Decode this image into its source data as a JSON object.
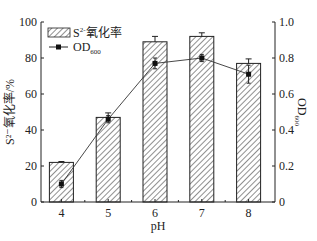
{
  "chart_data": {
    "type": "bar+line",
    "title": "",
    "xlabel": "pH",
    "ylabel_left": "S²⁻氧化率/%",
    "ylabel_right": "OD600",
    "categories": [
      "4",
      "5",
      "6",
      "7",
      "8"
    ],
    "series": [
      {
        "name": "S²⁻氧化率",
        "type": "bar",
        "axis": "left",
        "values": [
          22,
          47,
          89,
          92,
          77
        ],
        "errors": [
          0.5,
          2.5,
          3,
          2,
          2.5
        ]
      },
      {
        "name": "OD600",
        "type": "line",
        "axis": "right",
        "values": [
          0.1,
          0.46,
          0.77,
          0.8,
          0.71
        ],
        "errors": [
          0.02,
          0.02,
          0.03,
          0.02,
          0.05
        ]
      }
    ],
    "ylim_left": [
      0,
      100
    ],
    "ylim_right": [
      0,
      1.0
    ],
    "yticks_left": [
      "0",
      "20",
      "40",
      "60",
      "80",
      "100"
    ],
    "yticks_right": [
      "0",
      "0.2",
      "0.4",
      "0.6",
      "0.8",
      "1.0"
    ],
    "legend_position": "upper left",
    "grid": false
  },
  "legend": {
    "bar_label": "S",
    "bar_sup": "2-",
    "bar_rest": "氧化率",
    "line_label": "OD",
    "line_sub": "600"
  },
  "axes": {
    "xlabel": "pH",
    "ylabel_left": "S²⁻氧化率/%",
    "ylabel_right_main": "OD",
    "ylabel_right_sub": "600"
  }
}
